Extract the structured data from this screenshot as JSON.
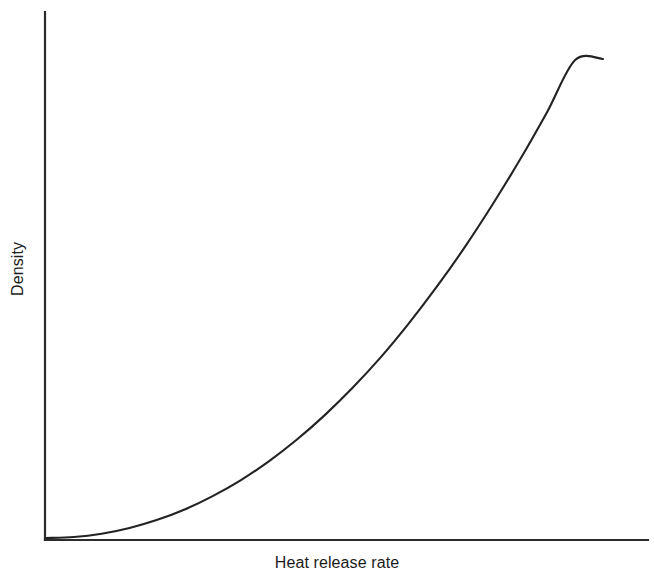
{
  "chart_data": {
    "type": "line",
    "title": "",
    "subtitle": "",
    "xlabel": "Heat release rate",
    "ylabel": "Density",
    "grid": false,
    "legend": null,
    "legend_position": "none",
    "axis_style": "open-left-bottom",
    "tick_labels_x": [],
    "tick_labels_y": [],
    "ticks_visible": false,
    "xlim": [
      0,
      1
    ],
    "ylim": [
      0,
      1
    ],
    "annotations": [],
    "series": [
      {
        "name": "Density vs heat release rate",
        "relationship": "monotonically increasing convex (power-law, approx y = x^2.2)",
        "color": "#232323",
        "line_width": 2.1,
        "x": [
          0.0,
          0.05,
          0.1,
          0.15,
          0.2,
          0.25,
          0.3,
          0.35,
          0.4,
          0.45,
          0.5,
          0.55,
          0.6,
          0.65,
          0.7,
          0.75,
          0.8,
          0.85,
          0.9,
          0.95,
          1.0
        ],
        "y": [
          0.0,
          0.002,
          0.009,
          0.021,
          0.038,
          0.06,
          0.088,
          0.121,
          0.16,
          0.205,
          0.256,
          0.313,
          0.376,
          0.446,
          0.522,
          0.604,
          0.693,
          0.788,
          0.89,
          0.998,
          1.0
        ]
      }
    ]
  },
  "figure": {
    "background_color": "#ffffff",
    "axis_color": "#2b2b2b",
    "text_color": "#1c1c1c"
  }
}
